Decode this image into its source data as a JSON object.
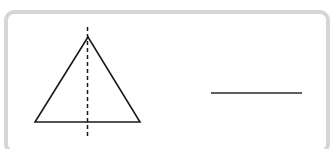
{
  "diagram": {
    "frame": {
      "border_color": "#d6d6d6",
      "background": "#ffffff"
    },
    "triangle": {
      "description": "isosceles triangle with vertical dashed axis of symmetry",
      "apex": [
        88,
        37
      ],
      "base_left": [
        35,
        122
      ],
      "base_right": [
        140,
        122
      ],
      "stroke_color": "#1a1a1a"
    },
    "symmetry_axis": {
      "style": "dashed",
      "x": 87,
      "y_top": 27,
      "y_bottom": 137,
      "stroke_color": "#1a1a1a"
    },
    "answer_line": {
      "description": "blank answer line",
      "x1": 211,
      "x2": 302,
      "y": 93,
      "stroke_color": "#2a2a2a"
    }
  }
}
